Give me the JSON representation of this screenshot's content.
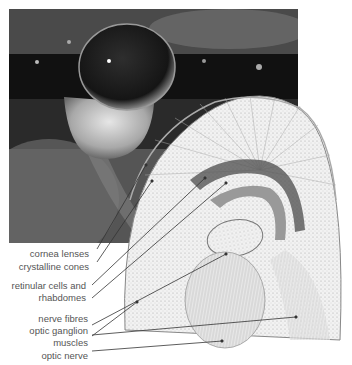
{
  "figure": {
    "photo_alt": "Close-up photograph of a compound eye",
    "diagram_alt": "Cross-section illustration of a compound eye"
  },
  "labels": [
    {
      "text": "cornea lenses"
    },
    {
      "text": "crystalline cones"
    },
    {
      "text": "retinular cells and"
    },
    {
      "text": "rhabdomes"
    },
    {
      "text": "nerve fibres"
    },
    {
      "text": "optic ganglion"
    },
    {
      "text": "muscles"
    },
    {
      "text": "optic nerve"
    }
  ],
  "colors": {
    "label_text": "#555555",
    "leader_line": "#333333"
  }
}
